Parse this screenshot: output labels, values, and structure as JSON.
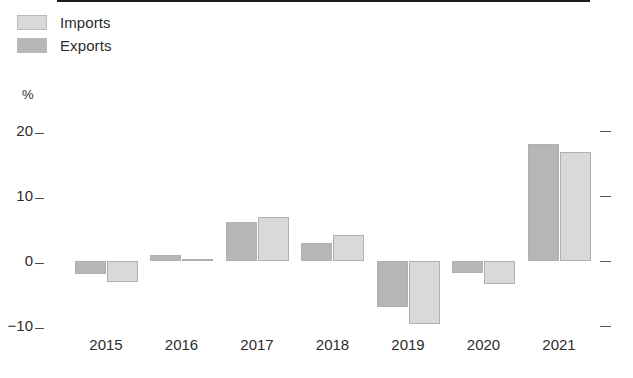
{
  "legend": {
    "position": "top-left",
    "items": [
      {
        "label": "Imports",
        "color": "#d9d9d9",
        "series_key": "imports"
      },
      {
        "label": "Exports",
        "color": "#b6b6b6",
        "series_key": "exports"
      }
    ]
  },
  "axes": {
    "unit_label": "%",
    "y_ticks": [
      {
        "label": "20",
        "value": 20
      },
      {
        "label": "10",
        "value": 10
      },
      {
        "label": "0",
        "value": 0
      },
      {
        "label": "−10",
        "value": -10
      }
    ],
    "right_ticks_labeled": false,
    "x_labels": [
      "2015",
      "2016",
      "2017",
      "2018",
      "2019",
      "2020",
      "2021"
    ]
  },
  "chart_data": {
    "type": "bar",
    "title": "",
    "xlabel": "",
    "ylabel": "%",
    "ylim": [
      -13,
      22
    ],
    "grid": false,
    "legend_position": "top-left",
    "categories": [
      "2015",
      "2016",
      "2017",
      "2018",
      "2019",
      "2020",
      "2021"
    ],
    "series": [
      {
        "name": "Exports",
        "color": "#b6b6b6",
        "draw_order": "left",
        "values": [
          -2.0,
          1.0,
          6.0,
          2.7,
          -7.0,
          -1.8,
          18.0
        ]
      },
      {
        "name": "Imports",
        "color": "#d9d9d9",
        "draw_order": "right",
        "values": [
          -3.3,
          0.3,
          6.8,
          4.0,
          -9.7,
          -3.5,
          16.7
        ]
      }
    ]
  }
}
